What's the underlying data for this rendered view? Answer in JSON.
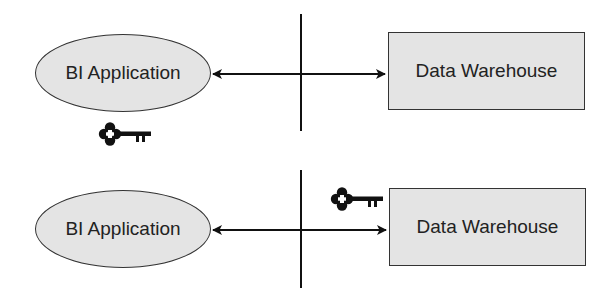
{
  "diagram": {
    "top": {
      "client_label": "BI Application",
      "server_label": "Data Warehouse",
      "key_position": "client side (below BI Application)"
    },
    "bottom": {
      "client_label": "BI Application",
      "server_label": "Data Warehouse",
      "key_position": "server side (above arrow near Data Warehouse)"
    },
    "colors": {
      "shape_fill": "#e4e4e4",
      "stroke": "#111111",
      "text": "#222222"
    },
    "icons": [
      "key-icon",
      "key-icon"
    ]
  }
}
